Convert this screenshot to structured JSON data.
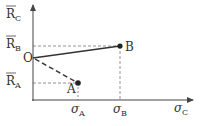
{
  "diagram": {
    "y_axis_label": {
      "main": "R",
      "sub": "C",
      "overbar": true
    },
    "x_axis_label": {
      "main": "σ",
      "sub": "C"
    },
    "origin_label": "O",
    "points": [
      {
        "id": "B",
        "label": "B",
        "x_label": {
          "main": "σ",
          "sub": "B"
        },
        "y_label": {
          "main": "R",
          "sub": "B",
          "overbar": true
        },
        "connector": "solid"
      },
      {
        "id": "A",
        "label": "A",
        "x_label": {
          "main": "σ",
          "sub": "A"
        },
        "y_label": {
          "main": "R",
          "sub": "A",
          "overbar": true
        },
        "connector": "dashed"
      }
    ],
    "colors": {
      "ink": "#333333",
      "guide": "#777777"
    }
  }
}
